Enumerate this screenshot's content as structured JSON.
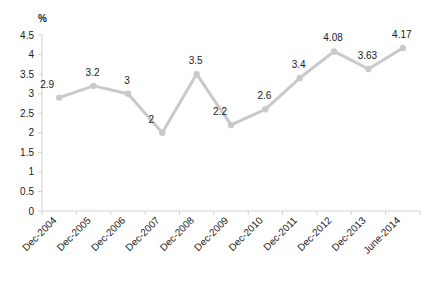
{
  "chart_data": {
    "type": "line",
    "title": "",
    "subtitle": "",
    "xlabel": "",
    "ylabel": "%",
    "unit_label": "%",
    "categories": [
      "Dec-2004",
      "Dec-2005",
      "Dec-2006",
      "Dec-2007",
      "Dec-2008",
      "Dec-2009",
      "Dec-2010",
      "Dec-2011",
      "Dec-2012",
      "Dec-2013",
      "June-2014"
    ],
    "values": [
      2.9,
      3.2,
      3,
      2,
      3.5,
      2.2,
      2.6,
      3.4,
      4.08,
      3.63,
      4.17
    ],
    "point_labels": [
      "2.9",
      "3.2",
      "3",
      "2",
      "3.5",
      "2.2",
      "2.6",
      "3.4",
      "4.08",
      "3.63",
      "4.17"
    ],
    "ylim": [
      0,
      4.5
    ],
    "ytick_values": [
      0,
      0.5,
      1,
      1.5,
      2,
      2.5,
      3,
      3.5,
      4,
      4.5
    ],
    "ytick_labels": [
      "0",
      "0.5",
      "1",
      "1.5",
      "2",
      "2.5",
      "3",
      "3.5",
      "4",
      "4.5"
    ],
    "grid": false,
    "legend": false,
    "legend_position": "none",
    "xtick_rotation_deg": -45,
    "colors": {
      "line": "#c9c9c9",
      "marker": "#c9c9c9",
      "axis": "#d2d2d2",
      "text": "#1a1a1a",
      "background": "#ffffff"
    }
  }
}
